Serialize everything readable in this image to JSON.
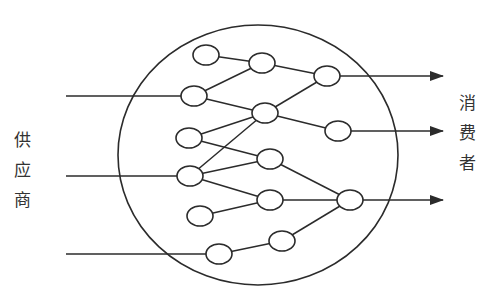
{
  "diagram": {
    "type": "network",
    "left_label": [
      "供",
      "应",
      "商"
    ],
    "right_label": [
      "消",
      "费",
      "者"
    ],
    "left_label_text": "供应商",
    "right_label_text": "消费者",
    "stroke_color": "#2b2b2b",
    "boundary": {
      "cx": 258,
      "cy": 155,
      "rx": 140,
      "ry": 130
    },
    "nodes": [
      {
        "id": "A",
        "x": 206,
        "y": 55
      },
      {
        "id": "B",
        "x": 194,
        "y": 96
      },
      {
        "id": "C",
        "x": 262,
        "y": 63
      },
      {
        "id": "D",
        "x": 327,
        "y": 76
      },
      {
        "id": "E",
        "x": 265,
        "y": 113
      },
      {
        "id": "F",
        "x": 189,
        "y": 138
      },
      {
        "id": "G",
        "x": 338,
        "y": 131
      },
      {
        "id": "H",
        "x": 190,
        "y": 176
      },
      {
        "id": "I",
        "x": 270,
        "y": 159
      },
      {
        "id": "J",
        "x": 270,
        "y": 200
      },
      {
        "id": "K",
        "x": 350,
        "y": 200
      },
      {
        "id": "L",
        "x": 200,
        "y": 216
      },
      {
        "id": "M",
        "x": 219,
        "y": 254
      },
      {
        "id": "N",
        "x": 282,
        "y": 241
      }
    ],
    "edges": [
      [
        "A",
        "C"
      ],
      [
        "B",
        "C"
      ],
      [
        "B",
        "E"
      ],
      [
        "C",
        "D"
      ],
      [
        "E",
        "D"
      ],
      [
        "E",
        "G"
      ],
      [
        "F",
        "E"
      ],
      [
        "F",
        "I"
      ],
      [
        "H",
        "E"
      ],
      [
        "H",
        "I"
      ],
      [
        "H",
        "J"
      ],
      [
        "L",
        "J"
      ],
      [
        "I",
        "K"
      ],
      [
        "J",
        "K"
      ],
      [
        "M",
        "N"
      ],
      [
        "N",
        "K"
      ]
    ],
    "inputs": [
      {
        "y": 96,
        "from_x": 66,
        "to": "B"
      },
      {
        "y": 176,
        "from_x": 66,
        "to": "H"
      },
      {
        "y": 254,
        "from_x": 66,
        "to": "M"
      }
    ],
    "outputs": [
      {
        "y": 76,
        "from": "D",
        "to_x": 443
      },
      {
        "y": 131,
        "from": "G",
        "to_x": 443
      },
      {
        "y": 200,
        "from": "K",
        "to_x": 443
      }
    ]
  }
}
